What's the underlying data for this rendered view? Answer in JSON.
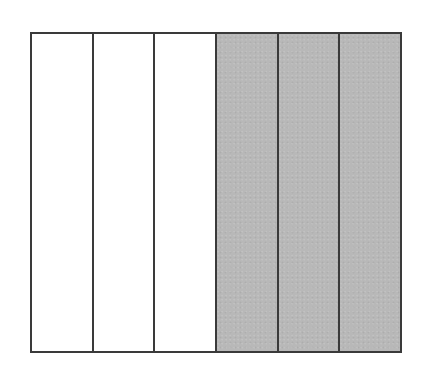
{
  "diagram": {
    "type": "fraction-bar",
    "total_parts": 6,
    "shaded_parts": 3,
    "fraction": "3/6",
    "orientation": "vertical-strips",
    "colors": {
      "border": "#3a3a3a",
      "shaded": "#b8b8b8",
      "unshaded": "#ffffff"
    },
    "parts": [
      {
        "index": 1,
        "shaded": false
      },
      {
        "index": 2,
        "shaded": false
      },
      {
        "index": 3,
        "shaded": false
      },
      {
        "index": 4,
        "shaded": true
      },
      {
        "index": 5,
        "shaded": true
      },
      {
        "index": 6,
        "shaded": true
      }
    ]
  }
}
